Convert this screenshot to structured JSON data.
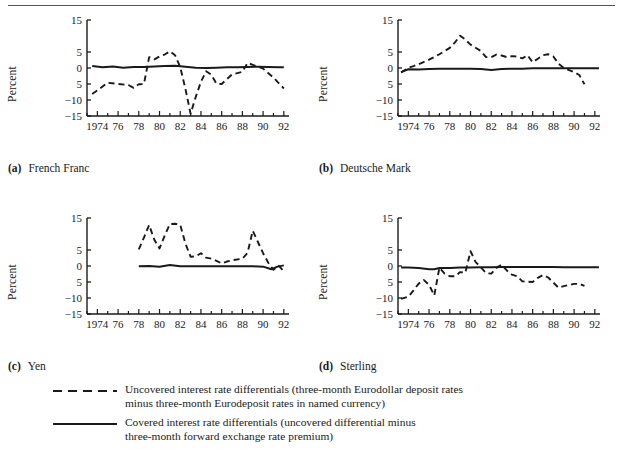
{
  "figure": {
    "ylabel": "Percent",
    "y_ticks": [
      "15",
      "5",
      "0",
      "5",
      "−10",
      "−15"
    ],
    "y_tick_values": [
      15,
      5,
      0,
      -5,
      -10,
      -15
    ],
    "x_ticks": [
      "1974",
      "76",
      "78",
      "80",
      "82",
      "84",
      "86",
      "88",
      "90",
      "92"
    ],
    "x_tick_values": [
      1974,
      1976,
      1978,
      1980,
      1982,
      1984,
      1986,
      1988,
      1990,
      1992
    ]
  },
  "panels": [
    {
      "key": "a",
      "tag": "(a)",
      "title": "French Franc"
    },
    {
      "key": "b",
      "tag": "(b)",
      "title": "Deutsche Mark"
    },
    {
      "key": "c",
      "tag": "(c)",
      "title": "Yen"
    },
    {
      "key": "d",
      "tag": "(d)",
      "title": "Sterling"
    }
  ],
  "legend": {
    "items": [
      {
        "style": "dashed",
        "line1": "Uncovered interest rate differentials (three-month Eurodollar deposit rates",
        "line2": "minus three-month Eurodeposit rates in named currency)"
      },
      {
        "style": "solid",
        "line1": "Covered interest rate differentials (uncovered differential minus",
        "line2": "three-month forward exchange rate premium)"
      }
    ]
  },
  "colors": {
    "ink": "#1a1a1a",
    "rule": "#555555",
    "background": "#ffffff"
  },
  "chart_data": [
    {
      "type": "line",
      "id": "french-franc",
      "title": "French Franc",
      "xlabel": "",
      "ylabel": "Percent",
      "ylim": [
        -15,
        15
      ],
      "xlim": [
        1973,
        1992.5
      ],
      "grid": false,
      "legend_position": "below-figure",
      "series": [
        {
          "name": "Uncovered interest rate differentials",
          "style": "dashed",
          "x": [
            1973.5,
            1974,
            1975,
            1976,
            1977,
            1977.5,
            1978,
            1978.5,
            1979,
            1979.5,
            1980,
            1980.5,
            1981,
            1981.5,
            1982,
            1982.5,
            1983,
            1983.5,
            1984,
            1984.5,
            1985,
            1985.5,
            1986,
            1986.5,
            1987,
            1988,
            1988.5,
            1989,
            1989.5,
            1990,
            1991,
            1992
          ],
          "y": [
            -8.1,
            -7.0,
            -4.6,
            -5.0,
            -5.3,
            -6.2,
            -5.1,
            -5.0,
            3.4,
            2.7,
            3.6,
            4.2,
            5.2,
            4.0,
            0.3,
            -6.5,
            -14.3,
            -9.0,
            -4.3,
            -1.0,
            -2.1,
            -4.9,
            -5.0,
            -3.5,
            -2.0,
            -1.2,
            1.6,
            1.0,
            0.4,
            -0.2,
            -3.0,
            -6.4
          ]
        },
        {
          "name": "Covered interest rate differentials",
          "style": "solid",
          "x": [
            1973.5,
            1974.5,
            1975.5,
            1976.5,
            1977.5,
            1978.5,
            1979.5,
            1980.5,
            1981.5,
            1982.5,
            1983.5,
            1984.5,
            1985.5,
            1986.5,
            1987.5,
            1988.5,
            1989.5,
            1990.5,
            1991.5,
            1992
          ],
          "y": [
            0.6,
            0.2,
            0.5,
            0.1,
            0.3,
            0.3,
            0.5,
            0.6,
            0.7,
            0.4,
            0.1,
            0.0,
            0.1,
            0.2,
            0.2,
            0.3,
            0.4,
            0.3,
            0.2,
            0.2
          ]
        }
      ]
    },
    {
      "type": "line",
      "id": "deutsche-mark",
      "title": "Deutsche Mark",
      "xlabel": "",
      "ylabel": "Percent",
      "ylim": [
        -15,
        15
      ],
      "xlim": [
        1973,
        1992.5
      ],
      "grid": false,
      "legend_position": "below-figure",
      "series": [
        {
          "name": "Uncovered interest rate differentials",
          "style": "dashed",
          "x": [
            1973.3,
            1974,
            1974.5,
            1975,
            1976,
            1977,
            1978,
            1978.5,
            1979,
            1979.5,
            1980,
            1981,
            1981.5,
            1982,
            1982.5,
            1983,
            1983.5,
            1984,
            1984.5,
            1985,
            1985.5,
            1986,
            1986.5,
            1987,
            1987.5,
            1988,
            1988.5,
            1989,
            1990,
            1990.5,
            1991
          ],
          "y": [
            -1.4,
            0.1,
            0.6,
            1.2,
            2.6,
            4.3,
            6.3,
            8.0,
            10.1,
            8.9,
            7.3,
            5.3,
            3.4,
            3.4,
            4.2,
            3.9,
            3.4,
            3.7,
            3.6,
            3.0,
            4.0,
            1.8,
            2.9,
            4.0,
            4.3,
            3.6,
            1.3,
            0.0,
            -1.3,
            -2.2,
            -5.1
          ]
        },
        {
          "name": "Covered interest rate differentials",
          "style": "solid",
          "x": [
            1973.3,
            1974,
            1975,
            1976,
            1977,
            1978,
            1979,
            1980,
            1981,
            1982,
            1983,
            1984,
            1985,
            1986,
            1987,
            1988,
            1989,
            1990,
            1991,
            1992.4
          ],
          "y": [
            -1.3,
            -0.4,
            -0.5,
            -0.3,
            -0.2,
            -0.2,
            -0.2,
            -0.2,
            -0.3,
            -0.6,
            -0.3,
            -0.2,
            -0.2,
            -0.1,
            -0.1,
            -0.1,
            -0.1,
            -0.1,
            -0.1,
            -0.1
          ]
        }
      ]
    },
    {
      "type": "line",
      "id": "yen",
      "title": "Yen",
      "xlabel": "",
      "ylabel": "Percent",
      "ylim": [
        -15,
        15
      ],
      "xlim": [
        1973,
        1992.5
      ],
      "grid": false,
      "legend_position": "below-figure",
      "series": [
        {
          "name": "Uncovered interest rate differentials",
          "style": "dashed",
          "x": [
            1978,
            1978.5,
            1979,
            1979.5,
            1980,
            1980.5,
            1981,
            1981.5,
            1982,
            1982.5,
            1983,
            1983.5,
            1984,
            1984.5,
            1985,
            1985.5,
            1986,
            1986.5,
            1987,
            1988,
            1988.5,
            1989,
            1989.5,
            1990,
            1990.5,
            1991,
            1991.5,
            1992
          ],
          "y": [
            5.2,
            8.9,
            12.8,
            8.2,
            5.5,
            9.5,
            13.1,
            13.2,
            12.9,
            7.0,
            2.9,
            3.0,
            4.0,
            2.6,
            2.3,
            1.6,
            0.8,
            1.4,
            1.8,
            2.3,
            4.1,
            11.0,
            7.5,
            4.0,
            1.0,
            -1.2,
            0.1,
            -1.7
          ]
        },
        {
          "name": "Covered interest rate differentials",
          "style": "solid",
          "x": [
            1978,
            1979,
            1980,
            1981,
            1982,
            1983,
            1984,
            1985,
            1986,
            1987,
            1988,
            1989,
            1990,
            1990.8,
            1991.4,
            1992
          ],
          "y": [
            -0.1,
            0.0,
            -0.2,
            0.3,
            -0.1,
            -0.1,
            -0.1,
            -0.1,
            -0.1,
            -0.1,
            -0.1,
            -0.1,
            -0.2,
            -1.0,
            -0.2,
            0.2
          ]
        }
      ]
    },
    {
      "type": "line",
      "id": "sterling",
      "title": "Sterling",
      "xlabel": "",
      "ylabel": "Percent",
      "ylim": [
        -15,
        15
      ],
      "xlim": [
        1973,
        1992.5
      ],
      "grid": false,
      "legend_position": "below-figure",
      "series": [
        {
          "name": "Uncovered interest rate differentials",
          "style": "dashed",
          "x": [
            1973.3,
            1974,
            1974.5,
            1975,
            1975.5,
            1976,
            1976.5,
            1977,
            1977.5,
            1978,
            1978.5,
            1979,
            1979.5,
            1980,
            1980.5,
            1981,
            1981.5,
            1982,
            1982.5,
            1983,
            1983.5,
            1984,
            1984.5,
            1985,
            1986,
            1986.5,
            1987,
            1987.5,
            1988,
            1988.5,
            1989,
            1990,
            1990.5,
            1991
          ],
          "y": [
            -10.3,
            -9.6,
            -7.6,
            -5.5,
            -4.4,
            -5.9,
            -9.2,
            -0.5,
            -2.4,
            -3.2,
            -3.2,
            -1.9,
            -2.1,
            4.6,
            1.2,
            -0.4,
            -2.2,
            -2.4,
            -0.6,
            0.4,
            -1.4,
            -2.7,
            -3.2,
            -4.8,
            -5.0,
            -3.7,
            -2.8,
            -3.6,
            -5.2,
            -6.8,
            -6.3,
            -5.6,
            -5.6,
            -6.2
          ]
        },
        {
          "name": "Covered interest rate differentials",
          "style": "solid",
          "x": [
            1973.3,
            1974,
            1975,
            1976,
            1976.5,
            1977,
            1978,
            1979,
            1980,
            1981,
            1982,
            1983,
            1984,
            1985,
            1986,
            1987,
            1988,
            1989,
            1990,
            1991,
            1992.4
          ],
          "y": [
            -0.5,
            -0.5,
            -0.6,
            -1.0,
            -1.0,
            -0.6,
            -0.6,
            -0.5,
            -0.5,
            -0.4,
            -0.4,
            -0.3,
            -0.3,
            -0.3,
            -0.3,
            -0.3,
            -0.3,
            -0.4,
            -0.4,
            -0.4,
            -0.4
          ]
        }
      ]
    }
  ]
}
